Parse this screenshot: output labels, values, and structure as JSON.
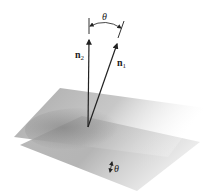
{
  "diagram": {
    "type": "angle-between-planes",
    "vectors": [
      {
        "name": "n2",
        "label": "n",
        "subscript": "2"
      },
      {
        "name": "n1",
        "label": "n",
        "subscript": "1"
      }
    ],
    "top_angle_label": "θ",
    "bottom_angle_label": "θ",
    "colors": {
      "plane": "#8a8a8a",
      "vector": "#222222",
      "background": "#ffffff"
    }
  }
}
